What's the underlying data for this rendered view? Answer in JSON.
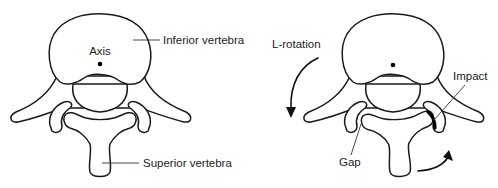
{
  "figure": {
    "type": "anatomical-diagram",
    "panels": [
      {
        "id": "neutral",
        "labels": {
          "axis": "Axis",
          "inferior": "Inferior vertebra",
          "superior": "Superior vertebra"
        }
      },
      {
        "id": "rotated",
        "labels": {
          "rotation": "L-rotation",
          "impact": "Impact",
          "gap": "Gap"
        }
      }
    ],
    "colors": {
      "line": "#1a1a1a",
      "fill": "#ffffff",
      "text": "#222222"
    }
  }
}
